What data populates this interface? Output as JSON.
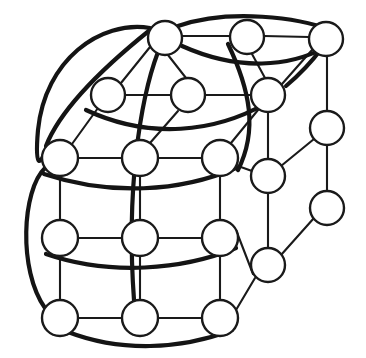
{
  "diagram": {
    "kind": "node-link-graph",
    "canvas": {
      "width": 366,
      "height": 358,
      "background": "#ffffff"
    },
    "style": {
      "node_fill": "#ffffff",
      "node_stroke": "#1a1a1a",
      "node_stroke_width": 2.4,
      "node_radius": 17,
      "edge_color": "#1a1a1a",
      "edge_thin_width": 2.1,
      "edge_thick_width": 4.2
    },
    "node_count": 20,
    "edge_count": 39,
    "nodes": [
      {
        "id": "n0",
        "name": "node-top-left",
        "cx": 165,
        "cy": 38,
        "r": 17,
        "label": ""
      },
      {
        "id": "n1",
        "name": "node-top-middle",
        "cx": 247,
        "cy": 37,
        "r": 17,
        "label": ""
      },
      {
        "id": "n2",
        "name": "node-top-right",
        "cx": 326,
        "cy": 39,
        "r": 17,
        "label": ""
      },
      {
        "id": "n3",
        "name": "node-row2-left",
        "cx": 108,
        "cy": 95,
        "r": 17,
        "label": ""
      },
      {
        "id": "n4",
        "name": "node-row2-middle",
        "cx": 188,
        "cy": 95,
        "r": 17,
        "label": ""
      },
      {
        "id": "n5",
        "name": "node-row2-right",
        "cx": 268,
        "cy": 95,
        "r": 17,
        "label": ""
      },
      {
        "id": "n6",
        "name": "node-row3-left",
        "cx": 60,
        "cy": 158,
        "r": 18,
        "label": ""
      },
      {
        "id": "n7",
        "name": "node-row3-middle",
        "cx": 140,
        "cy": 158,
        "r": 18,
        "label": ""
      },
      {
        "id": "n8",
        "name": "node-row3-right",
        "cx": 220,
        "cy": 158,
        "r": 18,
        "label": ""
      },
      {
        "id": "n9",
        "name": "node-row4-left",
        "cx": 60,
        "cy": 238,
        "r": 18,
        "label": ""
      },
      {
        "id": "n10",
        "name": "node-row4-middle",
        "cx": 140,
        "cy": 238,
        "r": 18,
        "label": ""
      },
      {
        "id": "n11",
        "name": "node-row4-right",
        "cx": 220,
        "cy": 238,
        "r": 18,
        "label": ""
      },
      {
        "id": "n12",
        "name": "node-row5-left",
        "cx": 60,
        "cy": 318,
        "r": 18,
        "label": ""
      },
      {
        "id": "n13",
        "name": "node-row5-middle",
        "cx": 140,
        "cy": 318,
        "r": 18,
        "label": ""
      },
      {
        "id": "n14",
        "name": "node-row5-right",
        "cx": 220,
        "cy": 318,
        "r": 18,
        "label": ""
      },
      {
        "id": "n15",
        "name": "node-inner-right-upper",
        "cx": 268,
        "cy": 176,
        "r": 17,
        "label": ""
      },
      {
        "id": "n16",
        "name": "node-inner-right-lower",
        "cx": 268,
        "cy": 265,
        "r": 17,
        "label": ""
      },
      {
        "id": "n17",
        "name": "node-outer-right-upper",
        "cx": 327,
        "cy": 128,
        "r": 17,
        "label": ""
      },
      {
        "id": "n18",
        "name": "node-outer-right-lower",
        "cx": 327,
        "cy": 208,
        "r": 17,
        "label": ""
      },
      {
        "id": "n19",
        "name": "node-row2-right-dup",
        "cx": 268,
        "cy": 95,
        "r": 17,
        "label": ""
      }
    ],
    "edges": [
      {
        "name": "edge-n0-n1",
        "weight": "thin",
        "d": "M 182 36 L 230 36"
      },
      {
        "name": "edge-n1-n2",
        "weight": "thin",
        "d": "M 264 36 L 309 37"
      },
      {
        "name": "edge-n0-n4",
        "weight": "thin",
        "d": "M 168 55 L 186 78"
      },
      {
        "name": "edge-n1-n5",
        "weight": "thin",
        "d": "M 252 54 L 265 78"
      },
      {
        "name": "edge-n2-n5",
        "weight": "thin",
        "d": "M 312 50 L 282 84"
      },
      {
        "name": "edge-n2-n17",
        "weight": "thin",
        "d": "M 327 56 L 327 111"
      },
      {
        "name": "edge-n0-n3",
        "weight": "thin",
        "d": "M 150 47 L 121 83"
      },
      {
        "name": "edge-n3-n4",
        "weight": "thin",
        "d": "M 125 95 L 171 95"
      },
      {
        "name": "edge-n4-n5",
        "weight": "thin",
        "d": "M 205 95 L 251 95"
      },
      {
        "name": "edge-n3-n6",
        "weight": "thin",
        "d": "M 98 108 L 72 144"
      },
      {
        "name": "edge-n4-n7",
        "weight": "thin",
        "d": "M 178 111 L 150 143"
      },
      {
        "name": "edge-n5-n8",
        "weight": "thin",
        "d": "M 258 110 L 231 143"
      },
      {
        "name": "edge-n5-n15",
        "weight": "thin",
        "d": "M 268 112 L 268 159"
      },
      {
        "name": "edge-n6-n7",
        "weight": "thin",
        "d": "M 78 158 L 122 158"
      },
      {
        "name": "edge-n7-n8",
        "weight": "thin",
        "d": "M 158 158 L 202 158"
      },
      {
        "name": "edge-n8-n15",
        "weight": "thin",
        "d": "M 238 166 L 252 171"
      },
      {
        "name": "edge-n15-n17",
        "weight": "thin",
        "d": "M 281 166 L 314 139"
      },
      {
        "name": "edge-n17-n18",
        "weight": "thin",
        "d": "M 327 145 L 327 191"
      },
      {
        "name": "edge-n15-n16",
        "weight": "thin",
        "d": "M 268 193 L 268 248"
      },
      {
        "name": "edge-n16-n18",
        "weight": "thin",
        "d": "M 281 255 L 314 218"
      },
      {
        "name": "edge-n6-n9",
        "weight": "thin",
        "d": "M 60 176 L 60 220"
      },
      {
        "name": "edge-n7-n10",
        "weight": "thin",
        "d": "M 140 176 L 140 220"
      },
      {
        "name": "edge-n8-n11",
        "weight": "thin",
        "d": "M 220 176 L 220 220"
      },
      {
        "name": "edge-n9-n10",
        "weight": "thin",
        "d": "M 78 238 L 122 238"
      },
      {
        "name": "edge-n10-n11",
        "weight": "thin",
        "d": "M 158 238 L 202 238"
      },
      {
        "name": "edge-n11-n16",
        "weight": "thin",
        "d": "M 236 230 L 253 274"
      },
      {
        "name": "edge-n9-n12",
        "weight": "thin",
        "d": "M 60 256 L 60 300"
      },
      {
        "name": "edge-n10-n13",
        "weight": "thin",
        "d": "M 140 256 L 140 300"
      },
      {
        "name": "edge-n11-n14",
        "weight": "thin",
        "d": "M 220 256 L 220 300"
      },
      {
        "name": "edge-n12-n13",
        "weight": "thin",
        "d": "M 78 318 L 122 318"
      },
      {
        "name": "edge-n13-n14",
        "weight": "thin",
        "d": "M 158 318 L 202 318"
      },
      {
        "name": "edge-n14-n16",
        "weight": "thin",
        "d": "M 236 310 L 255 278"
      },
      {
        "name": "edge-wrap-left-top",
        "weight": "thick",
        "d": "M 150 28 C 100 20 45 60 38 130 C 34 175 42 160 45 152"
      },
      {
        "name": "edge-wrap-left-bottom",
        "weight": "thick",
        "d": "M 45 168 C 22 190 18 270 45 308"
      },
      {
        "name": "edge-wrap-bottom",
        "weight": "thick",
        "d": "M 68 332 C 120 352 180 350 232 330"
      },
      {
        "name": "edge-wrap-top-arc1",
        "weight": "thick",
        "d": "M 178 26 C 230 8 300 18 330 30"
      },
      {
        "name": "edge-diag-cross-1",
        "weight": "thick",
        "d": "M 158 52 C 140 100 126 190 134 300"
      },
      {
        "name": "edge-diag-cross-2",
        "weight": "thick",
        "d": "M 228 44 C 250 90 258 130 238 170"
      },
      {
        "name": "edge-curve-row2",
        "weight": "thick",
        "d": "M 86 110 C 150 140 215 132 265 104"
      },
      {
        "name": "edge-curve-row3",
        "weight": "thick",
        "d": "M 44 174 C 110 196 180 192 236 168"
      },
      {
        "name": "edge-curve-row4",
        "weight": "thick",
        "d": "M 46 254 C 110 276 182 270 236 248"
      },
      {
        "name": "edge-curve-top2",
        "weight": "thick",
        "d": "M 182 46 C 240 72 290 66 324 48"
      },
      {
        "name": "edge-right-upper-link",
        "weight": "thick",
        "d": "M 286 86 C 305 70 316 56 322 48"
      },
      {
        "name": "edge-left-arc-join",
        "weight": "thick",
        "d": "M 46 146 C 60 110 100 70 150 30"
      }
    ]
  }
}
